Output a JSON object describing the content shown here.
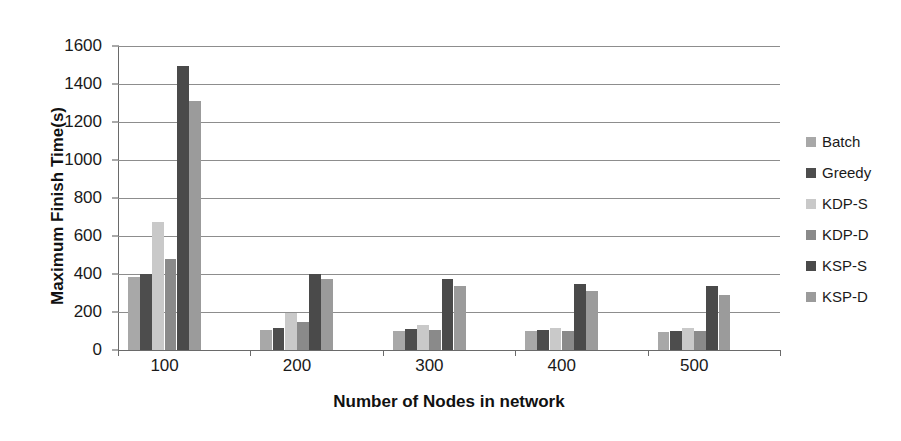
{
  "chart_data": {
    "type": "bar",
    "title": "",
    "xlabel": "Number of Nodes in network",
    "ylabel": "Maximum Finish Time(s)",
    "categories": [
      "100",
      "200",
      "300",
      "400",
      "500"
    ],
    "ylim": [
      0,
      1600
    ],
    "ytick_step": 200,
    "yticks": [
      "1600",
      "1400",
      "1200",
      "1000",
      "800",
      "600",
      "400",
      "200",
      "0"
    ],
    "grid": true,
    "legend_position": "right",
    "series": [
      {
        "name": "Batch",
        "color": "#a8a8a8",
        "values": [
          385,
          105,
          100,
          98,
          95
        ]
      },
      {
        "name": "Greedy",
        "color": "#4d4d4d",
        "values": [
          400,
          115,
          110,
          105,
          100
        ]
      },
      {
        "name": "KDP-S",
        "color": "#c9c9c9",
        "values": [
          675,
          195,
          130,
          115,
          115
        ]
      },
      {
        "name": "KDP-D",
        "color": "#8a8a8a",
        "values": [
          480,
          150,
          105,
          100,
          98
        ]
      },
      {
        "name": "KSP-S",
        "color": "#4a4a4a",
        "values": [
          1495,
          400,
          372,
          350,
          335
        ]
      },
      {
        "name": "KSP-D",
        "color": "#9b9b9b",
        "values": [
          1310,
          372,
          335,
          310,
          292
        ]
      }
    ]
  }
}
